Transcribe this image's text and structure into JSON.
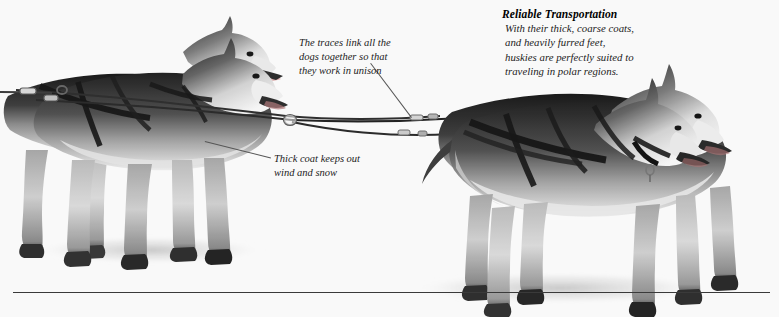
{
  "page": {
    "background_color": "#ffffff"
  },
  "captions": {
    "traces": "The traces link all the\ndogs together so that\nthey work in unison",
    "thick_coat": "Thick coat keeps out\nwind and snow"
  },
  "callout": {
    "title": "Reliable Transportation",
    "body": "With their thick, coarse coats,\nand heavily furred feet,\nhuskies are perfectly suited to\ntraveling in polar regions."
  },
  "rule": {
    "color": "#3a3a3a"
  },
  "photo": {
    "subject": "husky-sled-dog-team",
    "left_group_label": "left-husky-pair",
    "right_group_label": "right-husky-pair",
    "trace_lines_label": "harness-traces",
    "tone": "black-and-white"
  }
}
